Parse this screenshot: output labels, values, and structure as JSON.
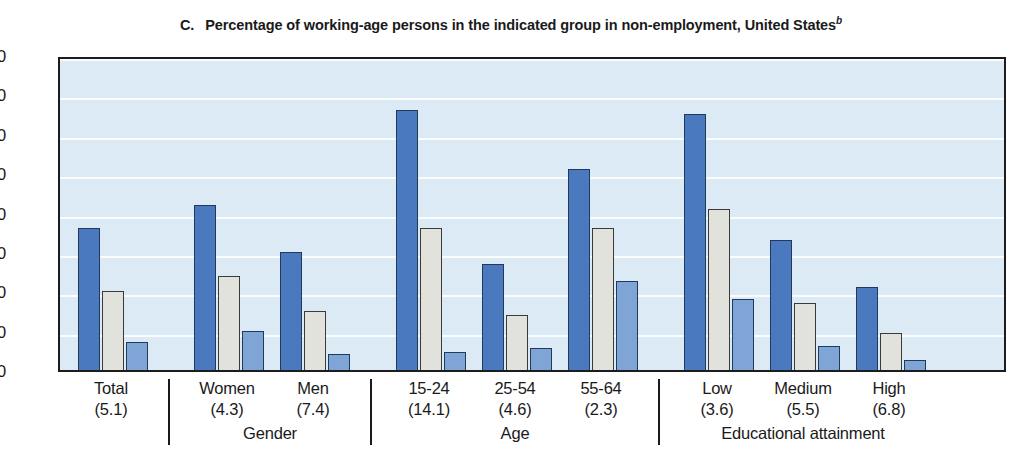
{
  "title": {
    "letter": "C.",
    "text": "Percentage of working-age persons in the indicated group in non-employment, United States",
    "superscript": "b"
  },
  "colors": {
    "series_1": "#4a79bf",
    "series_2": "#e2e2dd",
    "series_3": "#7fa4d6",
    "plot_background": "#dceaf5",
    "gridline": "#ffffff",
    "axis": "#1c1c1c",
    "text": "#1a1a1a"
  },
  "chart_data": {
    "type": "bar",
    "xlabel": "",
    "ylabel": "",
    "ylim": [
      0,
      80
    ],
    "yticks": [
      0,
      10,
      20,
      30,
      40,
      50,
      60,
      70,
      80
    ],
    "ytick_labels": [
      "0",
      "10",
      "20",
      "30",
      "40",
      "50",
      "60",
      "70",
      "80"
    ],
    "grid": true,
    "legend": "none",
    "categories": [
      "Total",
      "Women",
      "Men",
      "15-24",
      "25-54",
      "55-64",
      "Low",
      "Medium",
      "High"
    ],
    "category_sublabels": [
      "(5.1)",
      "(4.3)",
      "(7.4)",
      "(14.1)",
      "(4.6)",
      "(2.3)",
      "(3.6)",
      "(5.5)",
      "(6.8)"
    ],
    "groups": [
      {
        "name": "",
        "categories": [
          "Total"
        ]
      },
      {
        "name": "Gender",
        "categories": [
          "Women",
          "Men"
        ]
      },
      {
        "name": "Age",
        "categories": [
          "15-24",
          "25-54",
          "55-64"
        ]
      },
      {
        "name": "Educational attainment",
        "categories": [
          "Low",
          "Medium",
          "High"
        ]
      }
    ],
    "series": [
      {
        "name": "series-1",
        "color": "#4a79bf",
        "values": [
          36,
          42,
          30,
          66,
          27,
          51,
          65,
          33,
          21
        ]
      },
      {
        "name": "series-2",
        "color": "#e2e2dd",
        "values": [
          20,
          24,
          15,
          36,
          14,
          36,
          41,
          17,
          9.5
        ]
      },
      {
        "name": "series-3",
        "color": "#7fa4d6",
        "values": [
          7,
          10,
          4,
          4.5,
          5.5,
          22.5,
          18,
          6,
          2.5
        ]
      }
    ]
  }
}
